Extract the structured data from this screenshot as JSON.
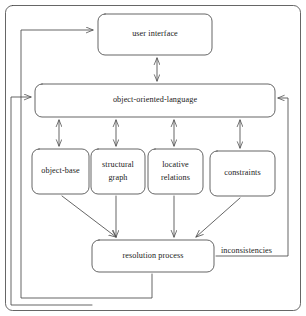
{
  "diagram": {
    "stroke_color": "#4a4a4a",
    "text_color": "#1a1a1a",
    "background_color": "#ffffff",
    "outer_frame": {
      "name": "system-boundary",
      "shape": "rounded-rectangle"
    },
    "nodes": [
      {
        "id": "user-interface",
        "lines": [
          "user interface"
        ],
        "x": 98,
        "y": 14,
        "w": 114,
        "h": 41
      },
      {
        "id": "object-oriented-language",
        "lines": [
          "object-oriented-language"
        ],
        "x": 35,
        "y": 84,
        "w": 240,
        "h": 33
      },
      {
        "id": "object-base",
        "lines": [
          "object-base"
        ],
        "x": 32,
        "y": 149,
        "w": 57,
        "h": 45
      },
      {
        "id": "structural-graph",
        "lines": [
          "structural",
          "graph"
        ],
        "x": 91,
        "y": 149,
        "w": 54,
        "h": 45
      },
      {
        "id": "locative-relations",
        "lines": [
          "locative",
          "relations"
        ],
        "x": 148,
        "y": 149,
        "w": 55,
        "h": 45
      },
      {
        "id": "constraints",
        "lines": [
          "constraints"
        ],
        "x": 210,
        "y": 151,
        "w": 65,
        "h": 45
      },
      {
        "id": "resolution-process",
        "lines": [
          "resolution process"
        ],
        "x": 92,
        "y": 240,
        "w": 122,
        "h": 32
      }
    ],
    "edge_labels": [
      {
        "id": "inconsistencies",
        "text": "inconsistencies",
        "x": 221,
        "y": 246
      }
    ],
    "edges": [
      {
        "from": "user-interface",
        "to": "object-oriented-language",
        "type": "bidirectional"
      },
      {
        "from": "object-oriented-language",
        "to": "object-base",
        "type": "bidirectional"
      },
      {
        "from": "object-oriented-language",
        "to": "structural-graph",
        "type": "bidirectional"
      },
      {
        "from": "object-oriented-language",
        "to": "locative-relations",
        "type": "bidirectional"
      },
      {
        "from": "object-oriented-language",
        "to": "constraints",
        "type": "bidirectional"
      },
      {
        "from": "object-base",
        "to": "resolution-process",
        "type": "directed"
      },
      {
        "from": "structural-graph",
        "to": "resolution-process",
        "type": "directed"
      },
      {
        "from": "locative-relations",
        "to": "resolution-process",
        "type": "directed"
      },
      {
        "from": "constraints",
        "to": "resolution-process",
        "type": "directed"
      },
      {
        "from": "resolution-process",
        "to": "user-interface",
        "type": "directed-routed-left"
      },
      {
        "from": "resolution-process",
        "to": "object-oriented-language",
        "type": "directed-routed-left"
      },
      {
        "from": "resolution-process",
        "to": "object-oriented-language",
        "type": "directed-routed-right",
        "label": "inconsistencies"
      }
    ]
  }
}
